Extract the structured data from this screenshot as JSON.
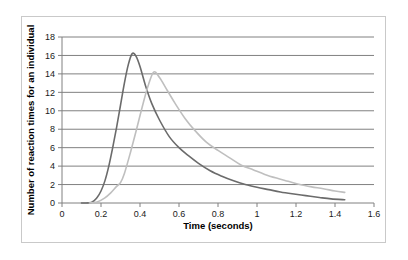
{
  "chart_data": {
    "type": "line",
    "title": "",
    "xlabel": "Time (seconds)",
    "ylabel": "Number of reaction times for an individual",
    "xlim": [
      0,
      1.6
    ],
    "ylim": [
      0,
      18
    ],
    "grid": "horizontal",
    "legend": "none",
    "xticks": [
      "0",
      "0.2",
      "0.4",
      "0.6",
      "0.8",
      "1",
      "1.2",
      "1.4",
      "1.6"
    ],
    "xtick_values": [
      0,
      0.2,
      0.4,
      0.6,
      0.8,
      1,
      1.2,
      1.4,
      1.6
    ],
    "yticks": [
      "0",
      "2",
      "4",
      "6",
      "8",
      "10",
      "12",
      "14",
      "16",
      "18"
    ],
    "ytick_values": [
      0,
      2,
      4,
      6,
      8,
      10,
      12,
      14,
      16,
      18
    ],
    "series": [
      {
        "name": "series-dark",
        "color": "#6b6b6b",
        "peak_x": 0.36,
        "peak_y": 16.2,
        "x": [
          0.1,
          0.15,
          0.18,
          0.2,
          0.22,
          0.24,
          0.26,
          0.28,
          0.3,
          0.32,
          0.34,
          0.36,
          0.38,
          0.4,
          0.43,
          0.46,
          0.5,
          0.55,
          0.6,
          0.65,
          0.7,
          0.76,
          0.82,
          0.88,
          0.94,
          1.0,
          1.06,
          1.12,
          1.18,
          1.25,
          1.32,
          1.38,
          1.45
        ],
        "y": [
          0.0,
          0.05,
          0.6,
          1.3,
          2.4,
          4.0,
          6.0,
          8.2,
          10.6,
          13.0,
          15.0,
          16.2,
          15.9,
          14.8,
          12.6,
          10.8,
          9.0,
          7.2,
          6.0,
          5.1,
          4.3,
          3.5,
          2.9,
          2.4,
          2.0,
          1.7,
          1.45,
          1.2,
          1.0,
          0.8,
          0.6,
          0.45,
          0.35
        ]
      },
      {
        "name": "series-light",
        "color": "#bfbfbf",
        "peak_x": 0.47,
        "peak_y": 14.2,
        "x": [
          0.14,
          0.18,
          0.22,
          0.25,
          0.28,
          0.3,
          0.32,
          0.35,
          0.38,
          0.41,
          0.44,
          0.47,
          0.5,
          0.54,
          0.58,
          0.63,
          0.68,
          0.74,
          0.8,
          0.86,
          0.92,
          0.98,
          1.04,
          1.1,
          1.16,
          1.22,
          1.28,
          1.34,
          1.4,
          1.45
        ],
        "y": [
          0.0,
          0.1,
          0.55,
          1.1,
          1.8,
          2.2,
          3.2,
          5.4,
          7.8,
          10.3,
          12.6,
          14.2,
          13.6,
          12.2,
          10.8,
          9.2,
          7.9,
          6.6,
          5.7,
          4.9,
          4.1,
          3.6,
          3.1,
          2.7,
          2.35,
          2.0,
          1.75,
          1.55,
          1.3,
          1.15
        ]
      }
    ]
  },
  "axes": {
    "xlabel": "Time (seconds)",
    "ylabel": "Number of reaction times for an individual"
  },
  "colors": {
    "series_dark": "#6b6b6b",
    "series_light": "#bfbfbf",
    "gridline": "#808080",
    "axis": "#808080",
    "card_border": "#c9c9c9",
    "background": "#ffffff",
    "text": "#1a1a1a"
  }
}
